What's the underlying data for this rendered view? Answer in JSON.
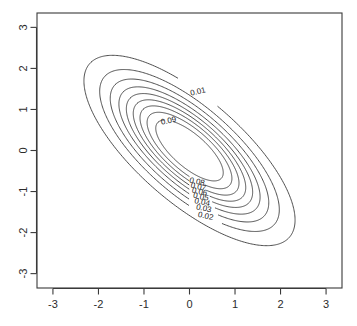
{
  "chart_data": {
    "type": "line",
    "subtype": "contour",
    "title": "",
    "xlabel": "",
    "ylabel": "",
    "xlim": [
      -3.35,
      3.35
    ],
    "ylim": [
      -3.35,
      3.35
    ],
    "grid": false,
    "legend": "none",
    "x_ticks": [
      "-3",
      "-2",
      "-1",
      "0",
      "1",
      "2",
      "3"
    ],
    "x_tick_values": [
      -3,
      -2,
      -1,
      0,
      1,
      2,
      3
    ],
    "y_ticks": [
      "3",
      "2",
      "1",
      "0",
      "-1",
      "-2",
      "-3"
    ],
    "y_tick_values": [
      3,
      2,
      1,
      0,
      -1,
      -2,
      -3
    ],
    "y_tick_label_rotation": -90,
    "density": {
      "description": "bivariate normal density",
      "mean_x": 0,
      "mean_y": 0,
      "sd_x": 1,
      "sd_y": 1,
      "correlation": -0.6,
      "peak_value": 0.0995
    },
    "levels": [
      0.01,
      0.02,
      0.03,
      0.04,
      0.05,
      0.06,
      0.07,
      0.08,
      0.09
    ],
    "level_labels": [
      "0.01",
      "0.02",
      "0.03",
      "0.04",
      "0.05",
      "0.06",
      "0.07",
      "0.08",
      "0.09"
    ],
    "contours": [
      {
        "level": 0.01,
        "label": "0.01",
        "semi_major": 3.05,
        "semi_minor": 1.205,
        "angle_deg": -45,
        "label_angle_deg": 107,
        "label_rotation_deg": -14
      },
      {
        "level": 0.02,
        "label": "0.02",
        "semi_major": 2.595,
        "semi_minor": 1.025,
        "angle_deg": -45,
        "label_angle_deg": -58,
        "label_rotation_deg": 12
      },
      {
        "level": 0.03,
        "label": "0.03",
        "semi_major": 2.29,
        "semi_minor": 0.905,
        "angle_deg": -45,
        "label_angle_deg": -58,
        "label_rotation_deg": 12
      },
      {
        "level": 0.04,
        "label": "0.04",
        "semi_major": 2.04,
        "semi_minor": 0.805,
        "angle_deg": -45,
        "label_angle_deg": -58,
        "label_rotation_deg": 12
      },
      {
        "level": 0.05,
        "label": "0.05",
        "semi_major": 1.825,
        "semi_minor": 0.72,
        "angle_deg": -45,
        "label_angle_deg": -58,
        "label_rotation_deg": 12
      },
      {
        "level": 0.06,
        "label": "0.06",
        "semi_major": 1.625,
        "semi_minor": 0.642,
        "angle_deg": -45,
        "label_angle_deg": -58,
        "label_rotation_deg": 12
      },
      {
        "level": 0.07,
        "label": "0.07",
        "semi_major": 1.43,
        "semi_minor": 0.565,
        "angle_deg": -45,
        "label_angle_deg": -58,
        "label_rotation_deg": 12
      },
      {
        "level": 0.08,
        "label": "0.08",
        "semi_major": 1.225,
        "semi_minor": 0.484,
        "angle_deg": -45,
        "label_angle_deg": -58,
        "label_rotation_deg": 12
      },
      {
        "level": 0.09,
        "label": "0.09",
        "semi_major": 0.975,
        "semi_minor": 0.385,
        "angle_deg": -45,
        "label_angle_deg": 150,
        "label_rotation_deg": -12
      }
    ],
    "colors": {
      "background": "#ffffff",
      "line": "#3a3a3a",
      "text": "#2b2b2b",
      "frame": "#3a3a3a"
    }
  },
  "plot_box": {
    "left": 37,
    "top": 13,
    "right": 342,
    "bottom": 288
  }
}
